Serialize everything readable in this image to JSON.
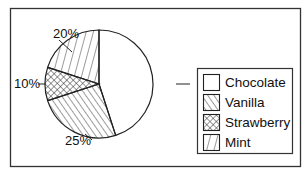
{
  "chart_data": {
    "type": "pie",
    "title": "",
    "start_angle": "12 o'clock",
    "direction": "clockwise",
    "categories": [
      "Chocolate",
      "Vanilla",
      "Strawberry",
      "Mint"
    ],
    "values": [
      45,
      25,
      10,
      20
    ],
    "labels": [
      "45%",
      "25%",
      "10%",
      "20%"
    ],
    "patterns": [
      "none",
      "diagonal-hatch",
      "crosshatch",
      "vertical-lines"
    ],
    "legend": {
      "position": "right",
      "entries": [
        {
          "label": "Chocolate",
          "pattern": "none"
        },
        {
          "label": "Vanilla",
          "pattern": "diagonal-hatch"
        },
        {
          "label": "Strawberry",
          "pattern": "crosshatch"
        },
        {
          "label": "Mint",
          "pattern": "vertical-lines"
        }
      ]
    },
    "colors": {
      "stroke": "#222222",
      "fill": "#ffffff"
    }
  }
}
